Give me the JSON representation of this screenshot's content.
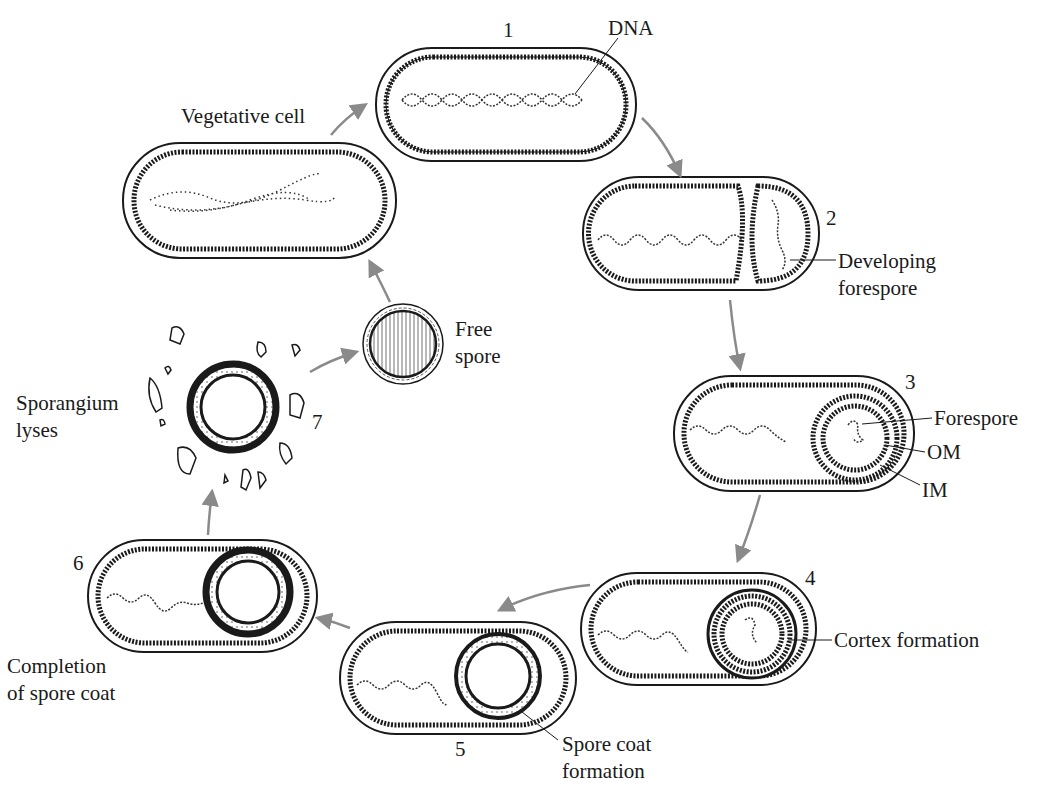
{
  "diagram": {
    "colors": {
      "ink": "#1a1a1a",
      "arrow": "#8a8a8a",
      "background": "#ffffff"
    },
    "stages": [
      {
        "number": "1",
        "label": "DNA"
      },
      {
        "number": "2",
        "label_line1": "Developing",
        "label_line2": "forespore"
      },
      {
        "number": "3",
        "labels": [
          "Forespore",
          "OM",
          "IM"
        ]
      },
      {
        "number": "4",
        "label": "Cortex formation"
      },
      {
        "number": "5",
        "label_line1": "Spore coat",
        "label_line2": "formation"
      },
      {
        "number": "6",
        "label_line1": "Completion",
        "label_line2": "of spore coat"
      },
      {
        "number": "7",
        "label_line1": "Sporangium",
        "label_line2": "lyses"
      }
    ],
    "free_spore": {
      "label_line1": "Free",
      "label_line2": "spore"
    },
    "vegetative_cell": {
      "label": "Vegetative cell"
    }
  }
}
